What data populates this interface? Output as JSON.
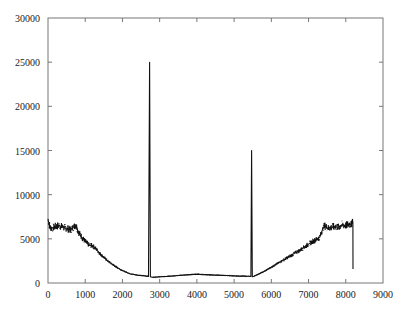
{
  "chart_data": {
    "type": "line",
    "title": "",
    "xlabel": "",
    "ylabel": "",
    "xlim": [
      0,
      9000
    ],
    "ylim": [
      0,
      30000
    ],
    "xticks": [
      0,
      1000,
      2000,
      3000,
      4000,
      5000,
      6000,
      7000,
      8000,
      9000
    ],
    "yticks": [
      0,
      5000,
      10000,
      15000,
      20000,
      25000,
      30000
    ],
    "xtick_labels": [
      "0",
      "1000",
      "2000",
      "3000",
      "4000",
      "5000",
      "6000",
      "7000",
      "8000",
      "9000"
    ],
    "ytick_labels": [
      "0",
      "5000",
      "10000",
      "15000",
      "20000",
      "25000",
      "30000"
    ],
    "grid": false,
    "legend": null,
    "series": [
      {
        "name": "signal",
        "color": "#111111",
        "x": [
          0,
          50,
          100,
          200,
          300,
          400,
          500,
          600,
          700,
          750,
          800,
          900,
          1000,
          1100,
          1200,
          1300,
          1400,
          1500,
          1600,
          1800,
          2000,
          2200,
          2400,
          2600,
          2700,
          2730,
          2750,
          2770,
          2800,
          3000,
          3200,
          3500,
          3800,
          4000,
          4200,
          4500,
          4800,
          5000,
          5200,
          5400,
          5450,
          5470,
          5490,
          5520,
          5600,
          5800,
          6000,
          6200,
          6400,
          6600,
          6800,
          6900,
          7000,
          7100,
          7200,
          7300,
          7400,
          7450,
          7500,
          7600,
          7700,
          7800,
          7900,
          8000,
          8100,
          8150,
          8180,
          8190,
          8195
        ],
        "y": [
          7200,
          6300,
          6200,
          6400,
          6500,
          6300,
          6200,
          6000,
          6400,
          6600,
          5900,
          5200,
          4700,
          4300,
          4200,
          3800,
          3300,
          2900,
          2500,
          1900,
          1400,
          1050,
          900,
          800,
          750,
          25000,
          700,
          680,
          650,
          700,
          750,
          850,
          950,
          1000,
          950,
          900,
          850,
          800,
          780,
          760,
          750,
          15000,
          700,
          750,
          900,
          1300,
          1800,
          2300,
          2800,
          3300,
          3800,
          4100,
          4400,
          4700,
          4900,
          5200,
          6300,
          6500,
          6200,
          6300,
          6400,
          6300,
          6600,
          6500,
          6700,
          6600,
          7200,
          6800,
          1600
        ]
      }
    ],
    "annotations": [
      {
        "text": "sharp peak",
        "x": 2750,
        "y": 25000
      },
      {
        "text": "sharp peak",
        "x": 5470,
        "y": 15000
      }
    ]
  }
}
